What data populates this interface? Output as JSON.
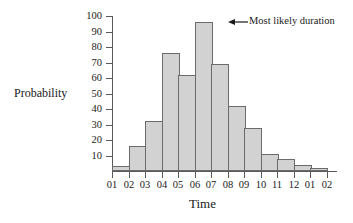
{
  "chart_data": {
    "type": "bar",
    "title": "",
    "xlabel": "Time",
    "ylabel": "Probability",
    "ylim": [
      0,
      100
    ],
    "ytick_values": [
      10,
      20,
      30,
      40,
      50,
      60,
      70,
      80,
      90,
      100
    ],
    "grid": false,
    "legend": null,
    "axis_tick_labels": [
      "01",
      "02",
      "03",
      "04",
      "05",
      "06",
      "07",
      "08",
      "09",
      "10",
      "11",
      "12",
      "01",
      "02"
    ],
    "categories": [
      "01-02",
      "02-03",
      "03-04",
      "04-05",
      "05-06",
      "06-07",
      "07-08",
      "08-09",
      "09-10",
      "10-11",
      "11-12",
      "12-01",
      "01-02"
    ],
    "values": [
      3,
      16,
      32,
      76,
      62,
      96,
      69,
      42,
      28,
      11,
      8,
      4,
      2
    ],
    "annotations": [
      {
        "text": "Most likely duration",
        "target_category": "06-07",
        "arrow": "left-arrow-icon"
      }
    ]
  },
  "labels": {
    "ylabel": "Probability",
    "xlabel": "Time",
    "annotation": "Most likely duration"
  }
}
